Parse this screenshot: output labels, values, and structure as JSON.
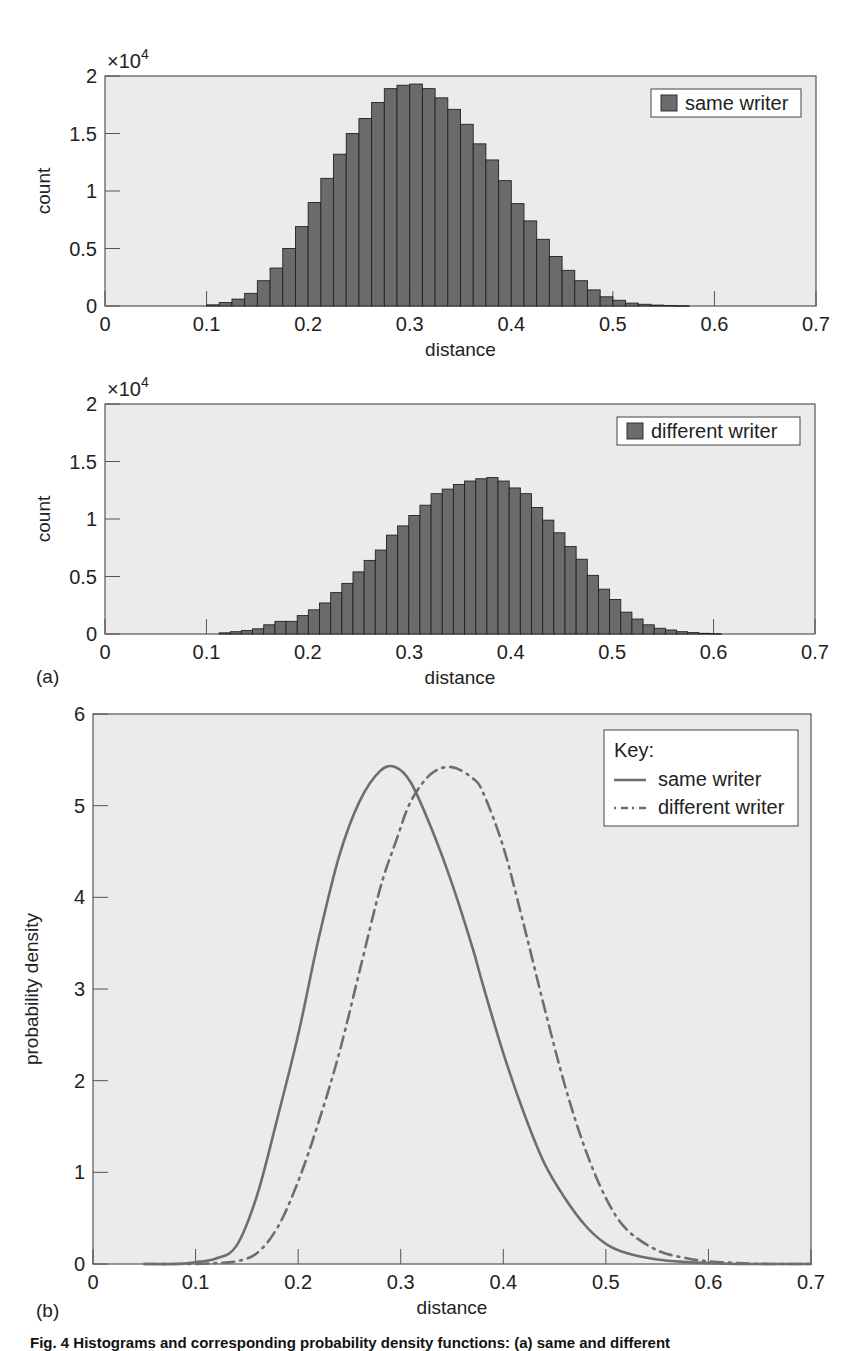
{
  "chart_data": [
    {
      "type": "bar",
      "panel": "(a) top",
      "title": "",
      "xlabel": "distance",
      "ylabel": "count",
      "y_multiplier": "×10^4",
      "xlim": [
        0,
        0.7
      ],
      "ylim": [
        0,
        2
      ],
      "xticks": [
        "0",
        "0.1",
        "0.2",
        "0.3",
        "0.4",
        "0.5",
        "0.6",
        "0.7"
      ],
      "yticks": [
        "0",
        "0.5",
        "1",
        "1.5",
        "2"
      ],
      "legend": [
        "same writer"
      ],
      "legend_position": "upper right",
      "bin_start": 0.1,
      "bin_width": 0.0125,
      "series": [
        {
          "name": "same writer",
          "values": [
            0.01,
            0.03,
            0.06,
            0.11,
            0.22,
            0.33,
            0.5,
            0.69,
            0.9,
            1.11,
            1.32,
            1.5,
            1.63,
            1.77,
            1.89,
            1.92,
            1.93,
            1.89,
            1.81,
            1.71,
            1.58,
            1.41,
            1.27,
            1.09,
            0.89,
            0.74,
            0.58,
            0.43,
            0.31,
            0.22,
            0.14,
            0.08,
            0.05,
            0.025,
            0.015,
            0.008,
            0.004,
            0.002
          ]
        }
      ]
    },
    {
      "type": "bar",
      "panel": "(a) bottom",
      "title": "",
      "xlabel": "distance",
      "ylabel": "count",
      "y_multiplier": "×10^4",
      "xlim": [
        0,
        0.7
      ],
      "ylim": [
        0,
        2
      ],
      "xticks": [
        "0",
        "0.1",
        "0.2",
        "0.3",
        "0.4",
        "0.5",
        "0.6",
        "0.7"
      ],
      "yticks": [
        "0",
        "0.5",
        "1",
        "1.5",
        "2"
      ],
      "legend": [
        "different writer"
      ],
      "legend_position": "upper right",
      "bin_start": 0.1125,
      "bin_width": 0.011,
      "series": [
        {
          "name": "different writer",
          "values": [
            0.01,
            0.02,
            0.03,
            0.045,
            0.08,
            0.11,
            0.11,
            0.16,
            0.21,
            0.27,
            0.36,
            0.44,
            0.54,
            0.64,
            0.73,
            0.86,
            0.94,
            1.03,
            1.12,
            1.22,
            1.26,
            1.3,
            1.33,
            1.35,
            1.36,
            1.33,
            1.27,
            1.22,
            1.1,
            0.99,
            0.88,
            0.76,
            0.65,
            0.51,
            0.39,
            0.3,
            0.19,
            0.13,
            0.08,
            0.05,
            0.035,
            0.02,
            0.012,
            0.006,
            0.003
          ]
        }
      ]
    },
    {
      "type": "line",
      "panel": "(b)",
      "title": "",
      "xlabel": "distance",
      "ylabel": "probability density",
      "xlim": [
        0,
        0.7
      ],
      "ylim": [
        0,
        6
      ],
      "xticks": [
        "0",
        "0.1",
        "0.2",
        "0.3",
        "0.4",
        "0.5",
        "0.6",
        "0.7"
      ],
      "yticks": [
        "0",
        "1",
        "2",
        "3",
        "4",
        "5",
        "6"
      ],
      "legend_title": "Key:",
      "legend": [
        "same writer",
        "different writer"
      ],
      "legend_position": "upper right",
      "x": [
        0.05,
        0.08,
        0.1,
        0.12,
        0.14,
        0.16,
        0.18,
        0.2,
        0.22,
        0.24,
        0.26,
        0.28,
        0.295,
        0.31,
        0.33,
        0.35,
        0.37,
        0.38,
        0.4,
        0.42,
        0.44,
        0.46,
        0.48,
        0.5,
        0.52,
        0.55,
        0.58,
        0.6,
        0.63,
        0.66,
        0.7
      ],
      "series": [
        {
          "name": "same writer",
          "style": "solid",
          "values": [
            0.0,
            0.0,
            0.02,
            0.06,
            0.2,
            0.75,
            1.6,
            2.5,
            3.55,
            4.45,
            5.05,
            5.38,
            5.42,
            5.25,
            4.75,
            4.15,
            3.45,
            3.05,
            2.3,
            1.65,
            1.1,
            0.72,
            0.42,
            0.22,
            0.12,
            0.05,
            0.02,
            0.01,
            0.0,
            0.0,
            0.0
          ]
        },
        {
          "name": "different writer",
          "style": "dash-dot",
          "values": [
            0.0,
            0.0,
            0.0,
            0.01,
            0.03,
            0.12,
            0.4,
            0.9,
            1.55,
            2.3,
            3.2,
            4.1,
            4.6,
            5.05,
            5.35,
            5.42,
            5.3,
            5.15,
            4.55,
            3.7,
            2.8,
            1.95,
            1.25,
            0.72,
            0.38,
            0.15,
            0.06,
            0.03,
            0.01,
            0.0,
            0.0
          ]
        }
      ]
    }
  ],
  "labels": {
    "multiplier_top": "×10",
    "multiplier_exp": "4",
    "panel_a": "(a)",
    "panel_b": "(b)",
    "caption": "Fig. 4 Histograms and corresponding probability density functions: (a) same and different"
  },
  "colors": {
    "plot_bg": "#ebebeb",
    "bar_fill": "#6b6b6b",
    "bar_edge": "#222222",
    "line": "#6e6e6e",
    "axis": "#555555"
  }
}
